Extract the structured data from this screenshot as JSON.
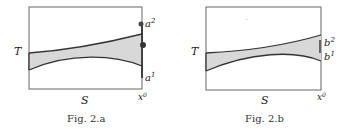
{
  "figures": [
    {
      "id": "fig-2a",
      "caption": "Fig. 2.a",
      "y_axis_label": "T",
      "x_axis_label": "S",
      "x_endpoint_label": "x",
      "x_endpoint_sup": "0",
      "right_labels": [
        {
          "base": "a",
          "sup": "2"
        },
        {
          "base": "a",
          "sup": "1"
        }
      ]
    },
    {
      "id": "fig-2b",
      "caption": "Fig. 2.b",
      "y_axis_label": "T",
      "x_axis_label": "S",
      "x_endpoint_label": "x",
      "x_endpoint_sup": "0",
      "right_labels": [
        {
          "base": "b",
          "sup": "2"
        },
        {
          "base": "b",
          "sup": "1"
        }
      ]
    }
  ],
  "colors": {
    "frame": "#555555",
    "curve": "#333333",
    "fill": "#d8d8d8"
  }
}
